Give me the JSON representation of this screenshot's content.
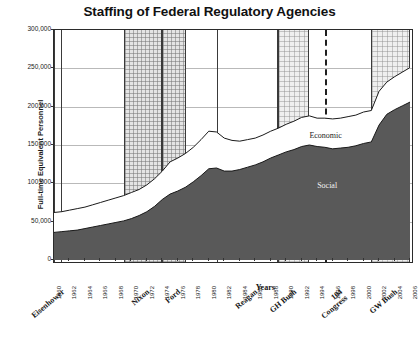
{
  "chart_data": {
    "type": "area",
    "title": "Staffing of Federal Regulatory Agencies",
    "xlabel": "Years",
    "ylabel": "Full-time Equivalent Personnel",
    "ylim": [
      0,
      300000
    ],
    "yticks": [
      "0",
      "50,000",
      "100,000",
      "150,000",
      "200,000",
      "250,000",
      "300,000"
    ],
    "ytick_values": [
      0,
      50000,
      100000,
      150000,
      200000,
      250000,
      300000
    ],
    "grid": true,
    "legend_position": "in-plot",
    "stacked": true,
    "x": [
      1960,
      1961,
      1962,
      1963,
      1964,
      1965,
      1966,
      1967,
      1968,
      1969,
      1970,
      1971,
      1972,
      1973,
      1974,
      1975,
      1976,
      1977,
      1978,
      1979,
      1980,
      1981,
      1982,
      1983,
      1984,
      1985,
      1986,
      1987,
      1988,
      1989,
      1990,
      1991,
      1992,
      1993,
      1994,
      1995,
      1996,
      1997,
      1998,
      1999,
      2000,
      2001,
      2002,
      2003,
      2004,
      2005,
      2006
    ],
    "xtick_labels": [
      "1960",
      "1962",
      "1964",
      "1966",
      "1968",
      "1970",
      "1972",
      "1974",
      "1976",
      "1978",
      "1980",
      "1982",
      "1984",
      "1986",
      "1988",
      "1990",
      "1992",
      "1994",
      "1996",
      "1998",
      "2000",
      "2002",
      "2004",
      "2006"
    ],
    "series": [
      {
        "name": "Social",
        "label": "Social",
        "color": "#595959",
        "values": [
          36000,
          37000,
          38000,
          39000,
          41000,
          43000,
          45000,
          47000,
          49000,
          51000,
          54000,
          58000,
          63000,
          70000,
          79000,
          86000,
          90000,
          95000,
          102000,
          110000,
          119000,
          120000,
          116000,
          116000,
          118000,
          121000,
          124000,
          128000,
          133000,
          137000,
          141000,
          144000,
          148000,
          150000,
          148000,
          147000,
          145000,
          146000,
          147000,
          149000,
          152000,
          154000,
          176000,
          190000,
          196000,
          201000,
          206000
        ]
      },
      {
        "name": "Economic",
        "label": "Economic",
        "color": "#ffffff",
        "values": [
          26000,
          26000,
          27000,
          28000,
          28000,
          29000,
          30000,
          31000,
          32000,
          33000,
          34000,
          34000,
          35000,
          36000,
          37000,
          42000,
          43000,
          44000,
          45000,
          47000,
          49000,
          47000,
          43000,
          40000,
          37000,
          36000,
          35000,
          35000,
          35000,
          35000,
          36000,
          37000,
          38000,
          38000,
          37000,
          38000,
          39000,
          39000,
          40000,
          40000,
          41000,
          41000,
          44000,
          42000,
          43000,
          44000,
          45000
        ]
      }
    ],
    "annotations": [
      {
        "text": "Economic",
        "x": 1993,
        "y": 162000
      },
      {
        "text": "Social",
        "x": 1994,
        "y": 96000
      }
    ],
    "eras": [
      {
        "label": "Eisenhower",
        "start": 1960,
        "end": 1961,
        "style": "plain"
      },
      {
        "label": "Nixon",
        "start": 1969,
        "end": 1974,
        "style": "hatch"
      },
      {
        "label": "Ford",
        "start": 1974,
        "end": 1977,
        "style": "hatch"
      },
      {
        "label": "Reagan",
        "start": 1981,
        "end": 1989,
        "style": "plain"
      },
      {
        "label": "GH Bush",
        "start": 1989,
        "end": 1993,
        "style": "hatch-light"
      },
      {
        "label": "104 Congress",
        "start": 1995,
        "end": 1995,
        "style": "dashed-line"
      },
      {
        "label": "GW Bush",
        "start": 2001,
        "end": 2006,
        "style": "hatch-light"
      }
    ]
  }
}
